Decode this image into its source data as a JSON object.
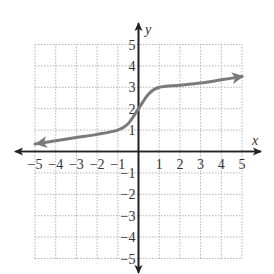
{
  "chart_data": {
    "type": "line",
    "title": "",
    "xlabel": "x",
    "ylabel": "y",
    "xlim": [
      -5,
      5
    ],
    "ylim": [
      -5,
      5
    ],
    "grid": true,
    "grid_style": "dotted",
    "x_ticks": [
      -5,
      -4,
      -3,
      -2,
      -1,
      1,
      2,
      3,
      4,
      5
    ],
    "y_ticks": [
      -5,
      -4,
      -3,
      -2,
      -1,
      1,
      2,
      3,
      4,
      5
    ],
    "x_tick_labels": [
      "−5",
      "−4",
      "−3",
      "−2",
      "−1",
      "1",
      "2",
      "3",
      "4",
      "5"
    ],
    "y_tick_labels": [
      "−5",
      "−4",
      "−3",
      "−2",
      "−1",
      "1",
      "2",
      "3",
      "4",
      "5"
    ],
    "series": [
      {
        "name": "f(x)",
        "description": "Increasing curve with arrows at both ends; nearly linear with shallow slope outside [-1,1], steep S-shaped rise through (0,2)",
        "x": [
          -5,
          -4,
          -3,
          -2,
          -1,
          -0.5,
          0,
          0.5,
          1,
          2,
          3,
          4,
          5
        ],
        "y": [
          0.35,
          0.5,
          0.65,
          0.8,
          1.0,
          1.3,
          2.0,
          2.7,
          3.0,
          3.1,
          3.2,
          3.35,
          3.5
        ],
        "arrows": "both",
        "color": "#7a7a7a"
      }
    ]
  },
  "colors": {
    "axis": "#222222",
    "grid": "#b5b5b5",
    "curve": "#7a7a7a",
    "text": "#333333"
  }
}
